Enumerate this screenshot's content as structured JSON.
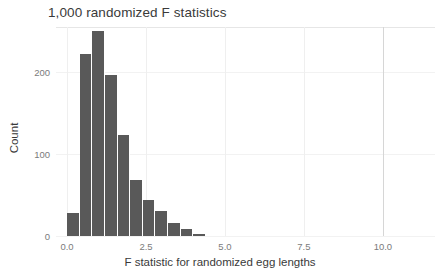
{
  "chart_data": {
    "type": "bar",
    "title": "1,000 randomized F statistics",
    "xlabel": "F statistic for randomized egg lengths",
    "ylabel": "Count",
    "xlim": [
      -0.35,
      11.65
    ],
    "ylim": [
      0,
      255
    ],
    "grid": true,
    "legend": "none",
    "bin_width": 0.4,
    "bin_starts": [
      0.0,
      0.4,
      0.8,
      1.2,
      1.6,
      2.0,
      2.4,
      2.8,
      3.2,
      3.6,
      4.0
    ],
    "categories": [
      "0.0-0.4",
      "0.4-0.8",
      "0.8-1.2",
      "1.2-1.6",
      "1.6-2.0",
      "2.0-2.4",
      "2.4-2.8",
      "2.8-3.2",
      "3.2-3.6",
      "3.6-4.0",
      "4.0-4.4"
    ],
    "values": [
      28,
      222,
      250,
      196,
      123,
      68,
      44,
      30,
      16,
      9,
      2
    ],
    "xticks": [
      {
        "value": 0.0,
        "label": "0.0"
      },
      {
        "value": 2.5,
        "label": "2.5"
      },
      {
        "value": 5.0,
        "label": "5.0"
      },
      {
        "value": 7.5,
        "label": "7.5"
      },
      {
        "value": 10.0,
        "label": "10.0"
      }
    ],
    "yticks": [
      {
        "value": 0,
        "label": "0"
      },
      {
        "value": 100,
        "label": "100"
      },
      {
        "value": 200,
        "label": "200"
      }
    ],
    "colors": {
      "bar_fill": "#595959",
      "bar_gap": "#ffffff",
      "background": "#ffffff",
      "gridline_major": "#d6d6d6",
      "gridline_minor": "#efefef",
      "tick_label": "#7b7b7b",
      "axis_title": "#3a3a3a",
      "title": "#3a3a3a"
    }
  }
}
